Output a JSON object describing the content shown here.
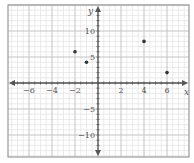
{
  "chart_data": {
    "type": "scatter",
    "title": "",
    "xlabel": "x",
    "ylabel": "y",
    "xlim": [
      -7.8,
      7.9
    ],
    "ylim": [
      -14.2,
      15
    ],
    "grid": true,
    "x_major_step": 2,
    "x_minor_step": 0.5,
    "y_major_step": 5,
    "y_minor_step": 1,
    "x_tick_labels": [
      "-6",
      "-4",
      "-2",
      "2",
      "4",
      "6"
    ],
    "x_ticks": [
      -6,
      -4,
      -2,
      2,
      4,
      6
    ],
    "y_tick_labels": [
      "10",
      "5",
      "-5",
      "-10"
    ],
    "y_ticks": [
      10,
      5,
      -5,
      -10
    ],
    "points": [
      {
        "x": -2,
        "y": 6
      },
      {
        "x": -1,
        "y": 4
      },
      {
        "x": 4,
        "y": 8
      },
      {
        "x": 6,
        "y": 2
      }
    ]
  },
  "colors": {
    "frame": "#9a9a9a",
    "minor_grid": "#e3e3e3",
    "major_grid": "#c4c4c4",
    "axis": "#555555",
    "point": "#333333"
  }
}
